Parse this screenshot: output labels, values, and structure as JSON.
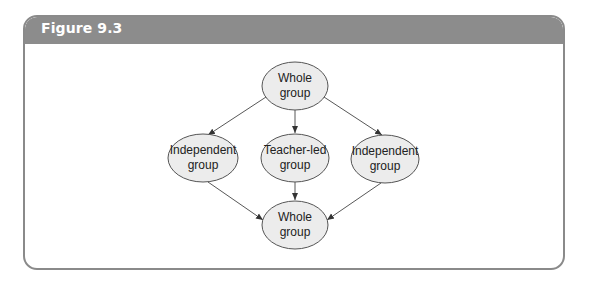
{
  "figure": {
    "title": "Figure 9.3"
  },
  "diagram": {
    "nodes": [
      {
        "id": "top",
        "line1": "Whole",
        "line2": "group",
        "cx": 295,
        "cy": 86,
        "rx": 33,
        "ry": 24
      },
      {
        "id": "left",
        "line1": "Independent",
        "line2": "group",
        "cx": 203,
        "cy": 158,
        "rx": 35,
        "ry": 24
      },
      {
        "id": "center",
        "line1": "Teacher-led",
        "line2": "group",
        "cx": 295,
        "cy": 158,
        "rx": 34,
        "ry": 24
      },
      {
        "id": "right",
        "line1": "Independent",
        "line2": "group",
        "cx": 385,
        "cy": 159,
        "rx": 34,
        "ry": 24
      },
      {
        "id": "bottom",
        "line1": "Whole",
        "line2": "group",
        "cx": 295,
        "cy": 225,
        "rx": 33,
        "ry": 24
      }
    ],
    "edges": [
      {
        "from": "top",
        "to": "left"
      },
      {
        "from": "top",
        "to": "center"
      },
      {
        "from": "top",
        "to": "right"
      },
      {
        "from": "left",
        "to": "bottom"
      },
      {
        "from": "center",
        "to": "bottom"
      },
      {
        "from": "right",
        "to": "bottom"
      }
    ],
    "colors": {
      "node_fill": "#ececec",
      "node_stroke": "#555555",
      "edge": "#444444",
      "header": "#8c8c8c"
    }
  }
}
